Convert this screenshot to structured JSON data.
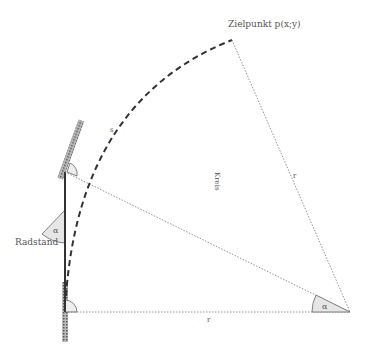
{
  "diagram": {
    "type": "geometry",
    "labels": {
      "target_point": "Zielpunkt p(x;y)",
      "wheelbase": "Radstand",
      "radius_bottom": "r",
      "radius_right": "r",
      "angle_center": "α",
      "angle_steering": "α",
      "angle_right_bottom": "·",
      "angle_right_top": "·",
      "arc_label": "s",
      "center_faint_text": "Kreis"
    },
    "points": {
      "rear_axle": [
        65,
        312
      ],
      "front_axle": [
        65,
        172
      ],
      "turn_center": [
        350,
        312
      ],
      "target_point": [
        232,
        40
      ]
    },
    "colors": {
      "line": "#555555",
      "dashed_arc": "#333333",
      "wheel_fill": "#888888",
      "angle_fill": "#e6e6e6"
    }
  }
}
